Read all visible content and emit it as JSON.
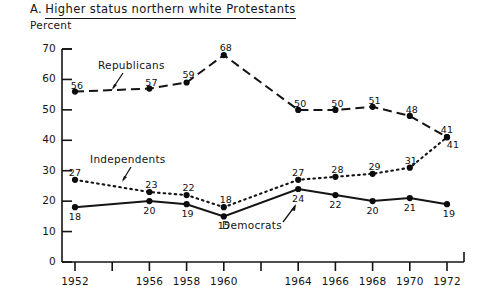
{
  "chart_data": {
    "type": "line",
    "title_prefix": "A.",
    "title_underlined": "Higher  status northern white Protestants",
    "ylabel": "Percent",
    "xlabel": "",
    "ylim": [
      0,
      70
    ],
    "yticks": [
      0,
      10,
      20,
      30,
      40,
      50,
      60,
      70
    ],
    "ytick_labels": [
      "0",
      "10",
      "20",
      "30",
      "40",
      "50",
      "60",
      "70"
    ],
    "x": [
      1952,
      1956,
      1958,
      1960,
      1964,
      1966,
      1968,
      1970,
      1972
    ],
    "xticks": [
      1952,
      1954,
      1956,
      1958,
      1960,
      1962,
      1964,
      1966,
      1968,
      1970,
      1972
    ],
    "xtick_labels": [
      "1952",
      "",
      "1956",
      "1958",
      "1960",
      "",
      "1964",
      "1966",
      "1968",
      "1970",
      "1972"
    ],
    "grid": false,
    "legend": "inline-annotations",
    "series": [
      {
        "name": "Republicans",
        "style": "dashed",
        "values": [
          56,
          57,
          59,
          68,
          50,
          50,
          51,
          48,
          41
        ],
        "labels": [
          "56",
          "57",
          "59",
          "68",
          "50",
          "50",
          "51",
          "48",
          "41"
        ]
      },
      {
        "name": "Independents",
        "style": "dotted",
        "values": [
          27,
          23,
          22,
          18,
          27,
          28,
          29,
          31,
          41
        ],
        "labels": [
          "27",
          "23",
          "22",
          "18",
          "27",
          "28",
          "29",
          "31",
          "41"
        ]
      },
      {
        "name": "Democrats",
        "style": "solid",
        "values": [
          18,
          20,
          19,
          15,
          24,
          22,
          20,
          21,
          19
        ],
        "labels": [
          "18",
          "20",
          "19",
          "15",
          "24",
          "22",
          "20",
          "21",
          "19"
        ]
      }
    ],
    "annotations": [
      {
        "text": "Republicans",
        "series": "Republicans"
      },
      {
        "text": "Independents",
        "series": "Independents"
      },
      {
        "text": "Democrats",
        "series": "Democrats"
      }
    ]
  }
}
